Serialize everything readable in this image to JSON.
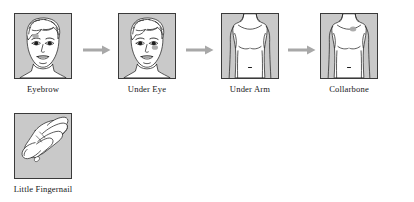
{
  "diagram": {
    "type": "process-flow",
    "background_color": "#ffffff",
    "panel_fill": "#c9c9c9",
    "panel_border": "#3a3a3a",
    "arrow_color": "#a8a8a8",
    "marker_color": "#a9a9a9",
    "line_color": "#1d1d1d",
    "steps": [
      {
        "index": 1,
        "label": "Eyebrow",
        "illustration": "female-face-front-icon",
        "marker_region": "above-left-eyebrow",
        "arrow_after": true
      },
      {
        "index": 2,
        "label": "Under Eye",
        "illustration": "female-face-front-icon",
        "marker_region": "under-right-eye",
        "arrow_after": true
      },
      {
        "index": 3,
        "label": "Under Arm",
        "illustration": "torso-front-icon",
        "marker_region": "under-arm",
        "arrow_after": true
      },
      {
        "index": 4,
        "label": "Collarbone",
        "illustration": "torso-front-icon",
        "marker_region": "collarbone",
        "arrow_after": false
      },
      {
        "index": 5,
        "label": "Little Fingernail",
        "illustration": "hand-icon",
        "marker_region": "little-fingernail",
        "arrow_after": false
      }
    ]
  }
}
